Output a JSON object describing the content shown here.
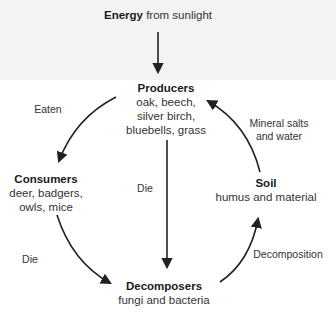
{
  "diagram": {
    "type": "nutrient cycle",
    "source": {
      "bold": "Energy",
      "rest": "from sunlight"
    },
    "nodes": {
      "producers": {
        "title": "Producers",
        "lines": [
          "oak, beech,",
          "silver birch,",
          "bluebells, grass"
        ]
      },
      "consumers": {
        "title": "Consumers",
        "lines": [
          "deer, badgers,",
          "owls, mice"
        ]
      },
      "decomposers": {
        "title": "Decomposers",
        "lines": [
          "fungi and bacteria"
        ]
      },
      "soil": {
        "title": "Soil",
        "lines": [
          "humus and material"
        ]
      }
    },
    "edges": [
      {
        "from": "sunlight",
        "to": "producers",
        "label": ""
      },
      {
        "from": "producers",
        "to": "consumers",
        "label": "Eaten"
      },
      {
        "from": "producers",
        "to": "decomposers",
        "label": "Die"
      },
      {
        "from": "consumers",
        "to": "decomposers",
        "label": "Die"
      },
      {
        "from": "decomposers",
        "to": "soil",
        "label": "Decomposition"
      },
      {
        "from": "soil",
        "to": "producers",
        "label_lines": [
          "Mineral salts",
          "and water"
        ]
      }
    ],
    "colors": {
      "arrow": "#222222",
      "top_band": "#f3f3f3",
      "background": "#ffffff"
    }
  }
}
